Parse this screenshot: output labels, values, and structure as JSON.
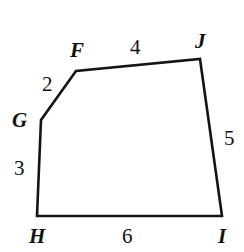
{
  "figure": {
    "name": "pentagon-FGHIJ",
    "stroke_color": "#141414",
    "background_color": "#ffffff",
    "stroke_width": 2.6,
    "vertices": [
      {
        "id": "F",
        "label": "F",
        "x": 76,
        "y": 71
      },
      {
        "id": "G",
        "label": "G",
        "x": 41,
        "y": 120
      },
      {
        "id": "H",
        "label": "H",
        "x": 37,
        "y": 216
      },
      {
        "id": "I",
        "label": "I",
        "x": 222,
        "y": 216
      },
      {
        "id": "J",
        "label": "J",
        "x": 200,
        "y": 59
      }
    ],
    "path": "M 76 71 L 200 59 L 222 216 L 37 216 L 41 120 Z",
    "sides": [
      {
        "id": "FJ",
        "from": "F",
        "to": "J",
        "length": "4"
      },
      {
        "id": "JI",
        "from": "J",
        "to": "I",
        "length": "5"
      },
      {
        "id": "IH",
        "from": "I",
        "to": "H",
        "length": "6"
      },
      {
        "id": "HG",
        "from": "H",
        "to": "G",
        "length": "3"
      },
      {
        "id": "GF",
        "from": "G",
        "to": "F",
        "length": "2"
      }
    ],
    "vertex_labels": {
      "F": "F",
      "G": "G",
      "H": "H",
      "I": "I",
      "J": "J"
    },
    "side_labels": {
      "FJ": "4",
      "GF": "2",
      "GH": "3",
      "HI": "6",
      "IJ": "5"
    }
  }
}
